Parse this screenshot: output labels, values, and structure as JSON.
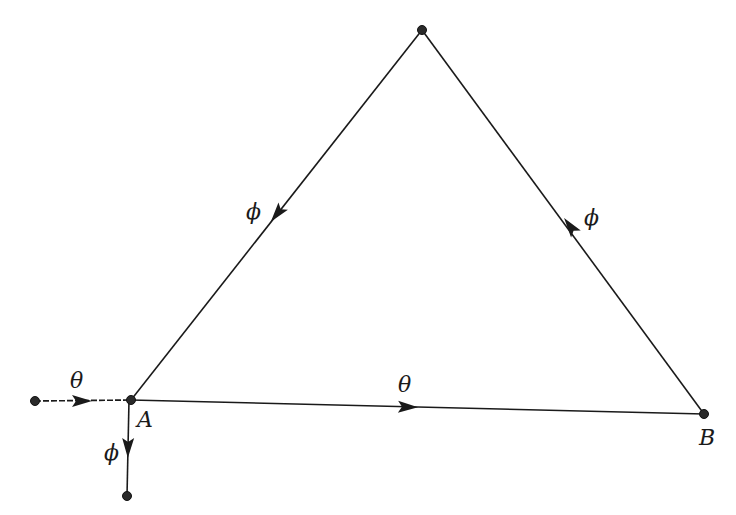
{
  "diagram": {
    "type": "signal-flow graph",
    "nodes": [
      {
        "id": "source",
        "label": "",
        "x": 35,
        "y": 401
      },
      {
        "id": "A",
        "label": "A",
        "x": 131,
        "y": 400
      },
      {
        "id": "top",
        "label": "",
        "x": 422,
        "y": 30
      },
      {
        "id": "B",
        "label": "B",
        "x": 704,
        "y": 414
      },
      {
        "id": "sink",
        "label": "",
        "x": 127,
        "y": 496
      }
    ],
    "edges": [
      {
        "from": "source",
        "to": "A",
        "label": "θ"
      },
      {
        "from": "A",
        "to": "B",
        "label": "θ"
      },
      {
        "from": "B",
        "to": "top",
        "label": "ϕ"
      },
      {
        "from": "top",
        "to": "A",
        "label": "ϕ"
      },
      {
        "from": "A",
        "to": "sink",
        "label": "ϕ"
      }
    ]
  },
  "labels": {
    "node_A": "A",
    "node_B": "B",
    "edge_input": "θ",
    "edge_AB": "θ",
    "edge_B_top": "ϕ",
    "edge_top_A": "ϕ",
    "edge_output": "ϕ"
  }
}
